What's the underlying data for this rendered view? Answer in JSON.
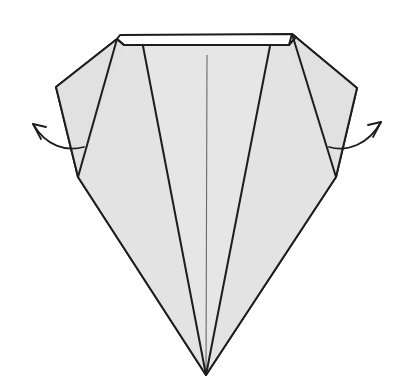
{
  "figure": {
    "kind": "origami-fold-diagram",
    "background_color": "#ffffff",
    "paper_fill": "#e4e4e4",
    "paper_fill_light": "#f2f2f2",
    "line_color": "#1d1d1d",
    "soft_line_color": "#555555",
    "canvas": {
      "width": 406,
      "height": 382
    }
  },
  "shapes": {
    "top_band": {
      "name": "top-folded-edge-band",
      "fill": "#ffffff",
      "points": "120,35 292,34 296,37 289,45 124,45 117,39"
    },
    "body_outline": {
      "name": "main-paper-outline",
      "fill": "#e4e4e4",
      "points": "117,39 56,87 78,177 206,375 336,177 357,88 292,34 289,45 124,45"
    },
    "left_wing": {
      "name": "left-wing-panel",
      "points": "117,39 56,87 78,177 143,46"
    },
    "right_wing": {
      "name": "right-wing-panel",
      "points": "292,34 357,88 336,177 270,46"
    },
    "left_inner_panel": {
      "name": "left-inner-panel",
      "points": "124,45 143,46 206,375 78,177"
    },
    "right_inner_panel": {
      "name": "right-inner-panel",
      "points": "289,45 270,46 206,375 336,177"
    },
    "center_panel": {
      "name": "center-panel",
      "points": "143,46 270,46 206,375"
    }
  },
  "fold_lines": [
    {
      "name": "fold-line-left-wing",
      "d": "M 117,39 L 78,177"
    },
    {
      "name": "fold-line-left-inner",
      "d": "M 143,46 L 206,375"
    },
    {
      "name": "fold-line-right-inner",
      "d": "M 270,46 L 206,375"
    },
    {
      "name": "fold-line-right-wing",
      "d": "M 292,34 L 336,177"
    },
    {
      "name": "fold-line-center-crease",
      "d": "M 207,55 L 206,375",
      "style": "soft"
    },
    {
      "name": "fold-line-top-band-lower",
      "d": "M 124,45 L 289,45"
    },
    {
      "name": "fold-line-top-band-upper",
      "d": "M 120,35 L 292,34"
    }
  ],
  "arrows": [
    {
      "name": "left-fold-arrow",
      "direction": "up-left",
      "path": "M 84,147 C 66,152 46,146 33,124",
      "head": "M 33,124 L 41,139 M 33,124 L 46,127"
    },
    {
      "name": "right-fold-arrow",
      "direction": "up-right",
      "path": "M 329,147 C 347,152 368,145 381,122",
      "head": "M 381,122 L 373,137 M 381,122 L 368,125"
    }
  ]
}
